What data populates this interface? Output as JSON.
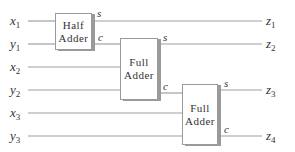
{
  "diagram": {
    "blocks": [
      {
        "id": "ha",
        "line1": "Half",
        "line2": "Adder"
      },
      {
        "id": "fa1",
        "line1": "Full",
        "line2": "Adder"
      },
      {
        "id": "fa2",
        "line1": "Full",
        "line2": "Adder"
      }
    ],
    "inputs": [
      {
        "name": "x",
        "sub": "1"
      },
      {
        "name": "y",
        "sub": "1"
      },
      {
        "name": "x",
        "sub": "2"
      },
      {
        "name": "y",
        "sub": "2"
      },
      {
        "name": "x",
        "sub": "3"
      },
      {
        "name": "y",
        "sub": "3"
      }
    ],
    "outputs": [
      {
        "name": "z",
        "sub": "1"
      },
      {
        "name": "z",
        "sub": "2"
      },
      {
        "name": "z",
        "sub": "3"
      },
      {
        "name": "z",
        "sub": "4"
      }
    ],
    "port_labels": {
      "sum": "s",
      "carry": "c"
    },
    "colors": {
      "line": "#9a9a9a",
      "text": "#333333",
      "shadow": "#9a9a9a"
    }
  }
}
